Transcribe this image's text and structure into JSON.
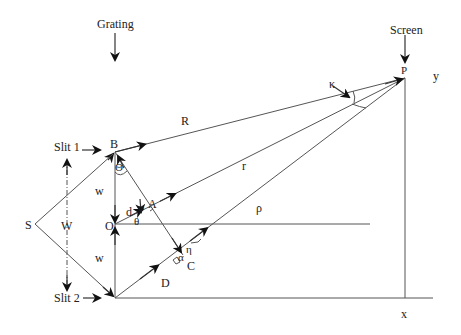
{
  "labels": {
    "grating": "Grating",
    "screen": "Screen",
    "slit1": "Slit 1",
    "slit2": "Slit 2",
    "S": "S",
    "W": "W",
    "w_upper": "w",
    "w_lower": "w",
    "B": "B",
    "O": "O",
    "A": "A",
    "C": "C",
    "D": "D",
    "P": "P",
    "R": "R",
    "r": "r",
    "rho": "ρ",
    "d": "d",
    "Theta": "Θ",
    "theta": "θ",
    "phi": "φ",
    "alpha": "α",
    "eta": "η",
    "kappa": "κ",
    "x": "x",
    "y": "y"
  }
}
